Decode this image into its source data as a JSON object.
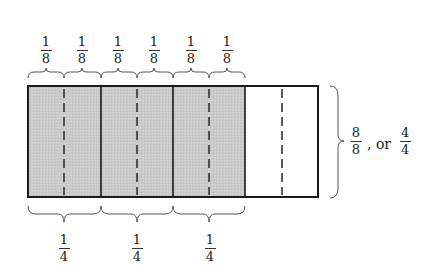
{
  "diagram": {
    "top_labels": [
      {
        "num": "1",
        "den": "8"
      },
      {
        "num": "1",
        "den": "8"
      },
      {
        "num": "1",
        "den": "8"
      },
      {
        "num": "1",
        "den": "8"
      },
      {
        "num": "1",
        "den": "8"
      },
      {
        "num": "1",
        "den": "8"
      }
    ],
    "bottom_labels": [
      {
        "num": "1",
        "den": "4"
      },
      {
        "num": "1",
        "den": "4"
      },
      {
        "num": "1",
        "den": "4"
      }
    ],
    "right_label": {
      "frac1": {
        "num": "8",
        "den": "8"
      },
      "connector": ", or",
      "frac2": {
        "num": "4",
        "den": "4"
      }
    },
    "parts_total": 4,
    "parts_shaded": 3,
    "subdivisions_per_part": 2,
    "colors": {
      "shade": "#c9c9c9",
      "outline": "#1a1a1a",
      "dash": "#333333",
      "brace": "#555555"
    }
  }
}
